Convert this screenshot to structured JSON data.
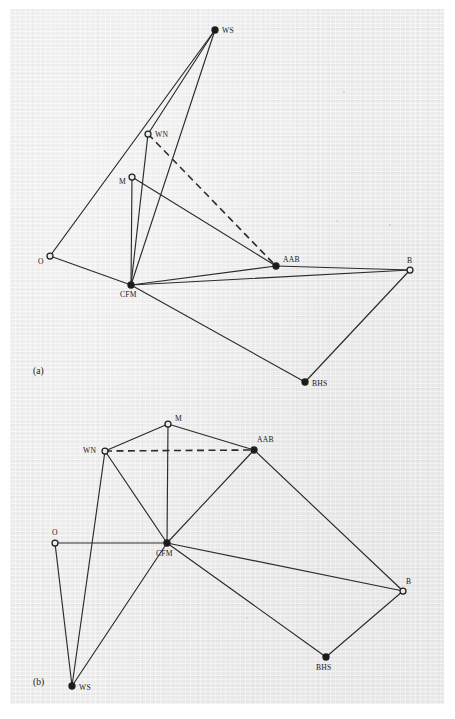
{
  "figure": {
    "background_color": "#ebebeb",
    "ink_color": "#1e1e1e",
    "panels": [
      {
        "id": "a",
        "label": "(a)",
        "label_x": 33,
        "label_y": 374,
        "nodes": [
          {
            "id": "WS",
            "label": "WS",
            "x": 215,
            "y": 30,
            "style": "filled",
            "label_dx": 7,
            "label_dy": 3
          },
          {
            "id": "WN",
            "label": "WN",
            "x": 148,
            "y": 134,
            "style": "open",
            "label_dx": 7,
            "label_dy": 3
          },
          {
            "id": "M",
            "label": "M",
            "x": 132,
            "y": 177,
            "style": "open",
            "label_dx": -13,
            "label_dy": 7
          },
          {
            "id": "O",
            "label": "O",
            "x": 50,
            "y": 256,
            "style": "open",
            "label_dx": -12,
            "label_dy": 8
          },
          {
            "id": "CFM",
            "label": "CFM",
            "x": 131,
            "y": 285,
            "style": "filled",
            "label_dx": -11,
            "label_dy": 12
          },
          {
            "id": "AAB",
            "label": "AAB",
            "x": 276,
            "y": 266,
            "style": "filled",
            "label_dx": 7,
            "label_dy": -4
          },
          {
            "id": "B",
            "label": "B",
            "x": 410,
            "y": 270,
            "style": "open",
            "label_dx": -3,
            "label_dy": -7
          },
          {
            "id": "BHS",
            "label": "BHS",
            "x": 305,
            "y": 382,
            "style": "filled",
            "label_dx": 7,
            "label_dy": 4
          }
        ],
        "edges": [
          {
            "from": "WS",
            "to": "O",
            "style": "solid"
          },
          {
            "from": "WS",
            "to": "WN",
            "style": "solid"
          },
          {
            "from": "WS",
            "to": "CFM",
            "style": "solid"
          },
          {
            "from": "WN",
            "to": "CFM",
            "style": "solid"
          },
          {
            "from": "M",
            "to": "CFM",
            "style": "solid"
          },
          {
            "from": "M",
            "to": "AAB",
            "style": "solid"
          },
          {
            "from": "O",
            "to": "CFM",
            "style": "solid"
          },
          {
            "from": "CFM",
            "to": "AAB",
            "style": "solid"
          },
          {
            "from": "CFM",
            "to": "B",
            "style": "solid"
          },
          {
            "from": "CFM",
            "to": "BHS",
            "style": "solid"
          },
          {
            "from": "AAB",
            "to": "B",
            "style": "solid"
          },
          {
            "from": "BHS",
            "to": "B",
            "style": "solid"
          },
          {
            "from": "WN",
            "to": "AAB",
            "style": "dashed"
          }
        ]
      },
      {
        "id": "b",
        "label": "(b)",
        "label_x": 33,
        "label_y": 685,
        "nodes": [
          {
            "id": "M",
            "label": "M",
            "x": 168,
            "y": 424,
            "style": "open",
            "label_dx": 7,
            "label_dy": -3
          },
          {
            "id": "WN",
            "label": "WN",
            "x": 105,
            "y": 451,
            "style": "open",
            "label_dx": -22,
            "label_dy": 2
          },
          {
            "id": "AAB",
            "label": "AAB",
            "x": 254,
            "y": 450,
            "style": "filled",
            "label_dx": 3,
            "label_dy": -8
          },
          {
            "id": "O",
            "label": "O",
            "x": 55,
            "y": 543,
            "style": "open",
            "label_dx": -3,
            "label_dy": -8
          },
          {
            "id": "CFM",
            "label": "CFM",
            "x": 167,
            "y": 543,
            "style": "filled",
            "label_dx": -11,
            "label_dy": 13
          },
          {
            "id": "B",
            "label": "B",
            "x": 403,
            "y": 591,
            "style": "open",
            "label_dx": 3,
            "label_dy": -7
          },
          {
            "id": "BHS",
            "label": "BHS",
            "x": 326,
            "y": 657,
            "style": "filled",
            "label_dx": -10,
            "label_dy": 13
          },
          {
            "id": "WS",
            "label": "WS",
            "x": 72,
            "y": 686,
            "style": "filled",
            "label_dx": 7,
            "label_dy": 4
          }
        ],
        "edges": [
          {
            "from": "WN",
            "to": "M",
            "style": "solid"
          },
          {
            "from": "M",
            "to": "AAB",
            "style": "solid"
          },
          {
            "from": "M",
            "to": "CFM",
            "style": "solid"
          },
          {
            "from": "WN",
            "to": "CFM",
            "style": "solid"
          },
          {
            "from": "WN",
            "to": "WS",
            "style": "solid"
          },
          {
            "from": "AAB",
            "to": "CFM",
            "style": "solid"
          },
          {
            "from": "AAB",
            "to": "B",
            "style": "solid"
          },
          {
            "from": "O",
            "to": "CFM",
            "style": "solid"
          },
          {
            "from": "O",
            "to": "WS",
            "style": "solid"
          },
          {
            "from": "CFM",
            "to": "B",
            "style": "solid"
          },
          {
            "from": "CFM",
            "to": "BHS",
            "style": "solid"
          },
          {
            "from": "CFM",
            "to": "WS",
            "style": "solid"
          },
          {
            "from": "BHS",
            "to": "B",
            "style": "solid"
          },
          {
            "from": "WN",
            "to": "AAB",
            "style": "dashed"
          }
        ]
      }
    ]
  }
}
